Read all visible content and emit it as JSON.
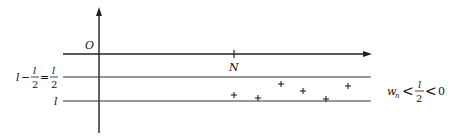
{
  "diagram": {
    "origin_label": "O",
    "point_label": "N",
    "left_labels": {
      "middle_lhs_l": "l",
      "middle_minus": "−",
      "frac_num": "l",
      "frac_den": "2",
      "equals": "=",
      "frac2_num": "l",
      "frac2_den": "2",
      "bottom": "l"
    },
    "condition": {
      "w": "w",
      "w_sub": "n",
      "lt1": "<",
      "frac_num": "l",
      "frac_den": "2",
      "lt2": "<",
      "zero": "0"
    },
    "markers": [
      {
        "x": 234,
        "y": 95
      },
      {
        "x": 258,
        "y": 98
      },
      {
        "x": 281,
        "y": 84
      },
      {
        "x": 303,
        "y": 91
      },
      {
        "x": 326,
        "y": 99
      },
      {
        "x": 348,
        "y": 86
      }
    ],
    "marker_symbol": "+",
    "line_color": "#222222"
  }
}
